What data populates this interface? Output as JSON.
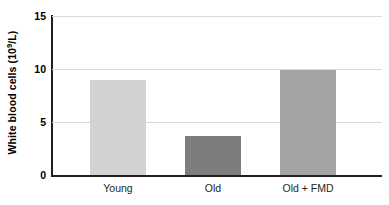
{
  "chart_data": {
    "type": "bar",
    "title": "",
    "xlabel": "",
    "ylabel": "White blood cells (10⁹/L)",
    "ylabel_base": "White blood cells (10",
    "ylabel_exponent": "9",
    "ylabel_tail": "/L)",
    "categories": [
      "Young",
      "Old",
      "Old + FMD"
    ],
    "values": [
      9.0,
      3.7,
      9.9
    ],
    "series": [
      {
        "name": "White blood cells",
        "values": [
          9.0,
          3.7,
          9.9
        ]
      }
    ],
    "bar_colors": [
      "#d2d2d2",
      "#7d7d7d",
      "#a4a4a4"
    ],
    "ylim": [
      0,
      15
    ],
    "yticks": [
      0,
      5,
      10,
      15
    ],
    "ytick_labels": [
      "0",
      "5",
      "10",
      "15"
    ],
    "grid": true,
    "grid_color": "#d9d9d9",
    "legend": "none",
    "axis_color": "#231f20",
    "background": "#ffffff"
  }
}
